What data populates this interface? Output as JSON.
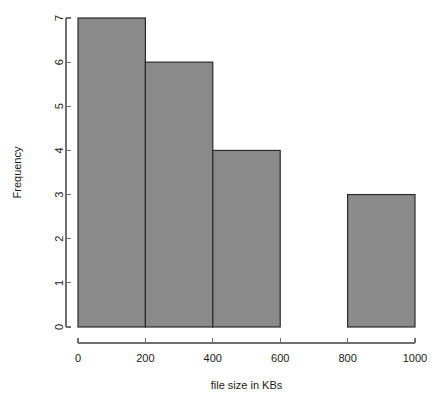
{
  "chart_data": {
    "type": "bar",
    "subtype": "histogram",
    "title": "",
    "xlabel": "file size in KBs",
    "ylabel": "Frequency",
    "xlim": [
      0,
      1000
    ],
    "ylim": [
      0,
      7
    ],
    "grid": false,
    "legend": null,
    "bin_width": 200,
    "bin_edges": [
      0,
      200,
      400,
      600,
      800,
      1000
    ],
    "categories": [
      "0-200",
      "200-400",
      "400-600",
      "600-800",
      "800-1000"
    ],
    "values": [
      7,
      6,
      4,
      0,
      3
    ],
    "bars": [
      {
        "label": "0-200",
        "x0": 0,
        "x1": 200,
        "value": 7
      },
      {
        "label": "200-400",
        "x0": 200,
        "x1": 400,
        "value": 6
      },
      {
        "label": "400-600",
        "x0": 400,
        "x1": 600,
        "value": 4
      },
      {
        "label": "600-800",
        "x0": 600,
        "x1": 800,
        "value": 0
      },
      {
        "label": "800-1000",
        "x0": 800,
        "x1": 1000,
        "value": 3
      }
    ],
    "xticks": [
      0,
      200,
      400,
      600,
      800,
      1000
    ],
    "xtick_labels": [
      "0",
      "200",
      "400",
      "600",
      "800",
      "1000"
    ],
    "yticks": [
      0,
      1,
      2,
      3,
      4,
      5,
      6,
      7
    ],
    "ytick_labels": [
      "0",
      "1",
      "2",
      "3",
      "4",
      "5",
      "6",
      "7"
    ],
    "colors": {
      "bar_fill": "#8a8a8a",
      "bar_border": "#2b2b2b",
      "axis": "#6f6f6f",
      "text": "#1a1a1a",
      "background": "#ffffff"
    }
  }
}
